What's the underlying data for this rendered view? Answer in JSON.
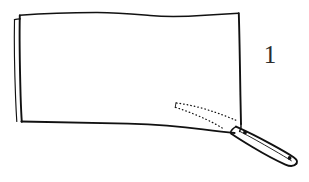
{
  "figure": {
    "number_label": "1",
    "caption": "",
    "background_color": "#ffffff",
    "ink_color": "#111111",
    "view": "side elevation, hand-drawn line art"
  },
  "parts": {
    "blade": {
      "name": "blade",
      "shape": "large quadrilateral panel",
      "outline_points": "18,16 238,13 241,124 20,120",
      "spine_edge_label": "blade spine",
      "cutting_edge_label": "cutting edge",
      "doubled_edge_label": "blade thickness line"
    },
    "handle": {
      "name": "handle",
      "shape": "elongated rounded bar angled down-right",
      "tip_label": "handle butt",
      "pivot_label": "pivot joint"
    },
    "pivot_rivet": {
      "name": "pivot rivet",
      "cx": 245,
      "cy": 132
    },
    "butt_rivet": {
      "name": "butt rivet",
      "cx": 290,
      "cy": 158
    },
    "fold_path": {
      "name": "blade fold path",
      "style": "dotted",
      "meaning": "indicates the arc the blade travels when folding into the handle",
      "arc_count": 2
    }
  },
  "annotations": {
    "number_position": "upper right",
    "dotted_arcs_position": "lower right interior of blade"
  }
}
